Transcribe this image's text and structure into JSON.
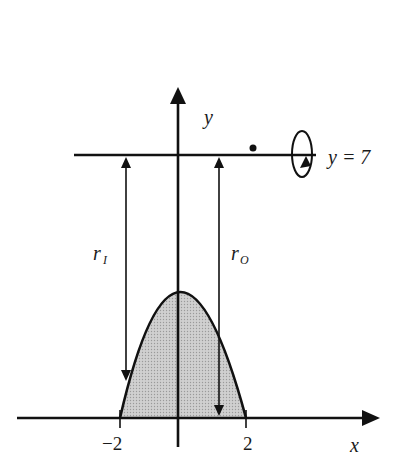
{
  "diagram": {
    "type": "washer-method region revolved about horizontal line",
    "axes": {
      "x_label": "x",
      "y_label": "y",
      "x_ticks": [
        {
          "value": -2,
          "label": "−2"
        },
        {
          "value": 2,
          "label": "2"
        }
      ]
    },
    "curve": {
      "shape": "downward parabola",
      "roots": [
        -2,
        2
      ],
      "shaded_region": "between parabola and x-axis",
      "fill_color": "#c8c8c8"
    },
    "axis_of_revolution": {
      "label": "y = 7",
      "rotation_symbol": "ellipse-with-arrow"
    },
    "radii": {
      "inner": {
        "label_main": "r",
        "label_sub": "I"
      },
      "outer": {
        "label_main": "r",
        "label_sub": "O"
      }
    },
    "colors": {
      "stroke": "#111111",
      "background": "#ffffff",
      "shade": "#c8c8c8"
    }
  }
}
